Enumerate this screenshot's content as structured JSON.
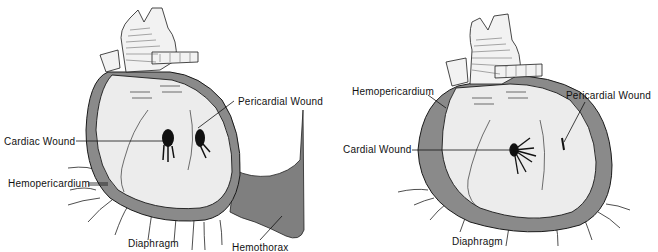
{
  "figure": {
    "colors": {
      "pericardium_blood": "#8a8a8a",
      "hemothorax": "#7f7f7f",
      "heart_fill": "#ececec",
      "outline": "#1a1a1a",
      "wound": "#111111",
      "background": "#ffffff"
    },
    "panels": [
      {
        "id": "left",
        "labels": {
          "pericardial_wound": "Pericardial Wound",
          "cardiac_wound": "Cardiac Wound",
          "hemopericardium": "Hemopericardium",
          "diaphragm": "Diaphragm",
          "hemothorax": "Hemothorax"
        }
      },
      {
        "id": "right",
        "labels": {
          "hemopericardium": "Hemopericardium",
          "pericardial_wound": "Pericardial Wound",
          "cardial_wound": "Cardial Wound",
          "diaphragm": "Diaphragm"
        }
      }
    ]
  }
}
